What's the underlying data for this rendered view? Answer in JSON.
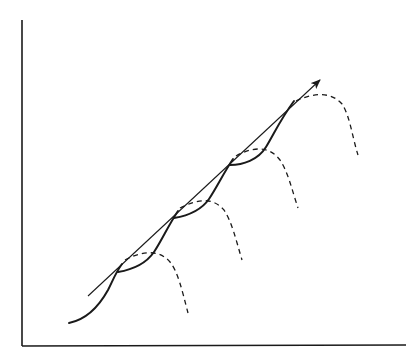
{
  "diagram": {
    "axes": {
      "x_label": "",
      "y_label": "",
      "origin": [
        22,
        346
      ],
      "y_top": 20,
      "x_right": 406
    },
    "trend_arrow": {
      "from": [
        88,
        296
      ],
      "to": [
        320,
        80
      ]
    },
    "s_curve_count": 5,
    "dashed_continuation_count": 5,
    "colors": {
      "line": "#1a1a1a",
      "background": "#ffffff"
    }
  }
}
